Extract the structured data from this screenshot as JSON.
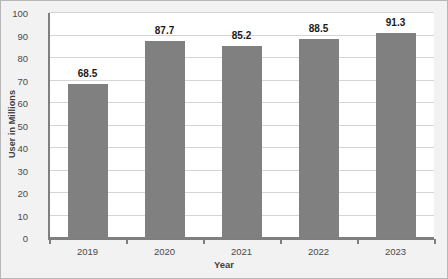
{
  "chart_data": {
    "type": "bar",
    "title": "",
    "categories": [
      "2019",
      "2020",
      "2021",
      "2022",
      "2023"
    ],
    "values": [
      68.5,
      87.7,
      85.2,
      88.5,
      91.3
    ],
    "data_labels": [
      "68.5",
      "87.7",
      "85.2",
      "88.5",
      "91.3"
    ],
    "xlabel": "Year",
    "ylabel": "User in Millions",
    "ylim": [
      0,
      100
    ],
    "ytick_labels": [
      "0",
      "10",
      "20",
      "30",
      "40",
      "50",
      "60",
      "70",
      "80",
      "90",
      "100"
    ],
    "ytick_values": [
      0,
      10,
      20,
      30,
      40,
      50,
      60,
      70,
      80,
      90,
      100
    ],
    "grid": true,
    "grid_orientation": "horizontal",
    "legend": false,
    "series": [
      {
        "name": "User in Millions",
        "values": [
          68.5,
          87.7,
          85.2,
          88.5,
          91.3
        ]
      }
    ]
  },
  "style": {
    "bar_color": "#808080",
    "plot_background": "#ffffff",
    "figure_background": "#f2f2f2",
    "gridline_color": "#d4d4d4",
    "axis_color": "#7f7f7f",
    "label_color": "#4a4a4a",
    "value_label_color": "#1a1a1a",
    "border_color": "#b7b7b7"
  }
}
